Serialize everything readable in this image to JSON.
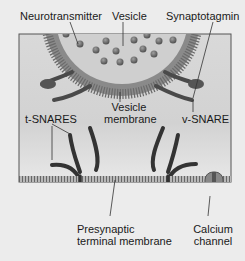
{
  "diagram": {
    "type": "synaptic vesicle fusion / SNARE complex",
    "labels": {
      "neurotransmitter": "Neurotransmitter",
      "vesicle": "Vesicle",
      "synaptotagmin": "Synaptotagmin",
      "t_snares": "t-SNARES",
      "vesicle_membrane_line1": "Vesicle",
      "vesicle_membrane_line2": "membrane",
      "v_snare": "v-SNARE",
      "presynaptic_line1": "Presynaptic",
      "presynaptic_line2": "terminal membrane",
      "calcium_line1": "Calcium",
      "calcium_line2": "channel"
    },
    "colors": {
      "background": "#ececec",
      "panel": "#d6d6d6",
      "vesicle_fill": "#c8c8c8",
      "membrane": "#777777",
      "protein": "#333333",
      "dots": "#7a7a7a"
    }
  }
}
